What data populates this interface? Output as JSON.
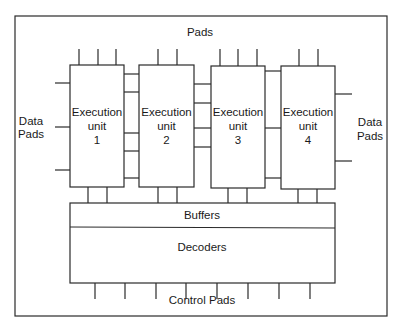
{
  "diagram": {
    "type": "block-diagram",
    "top_label": "Pads",
    "left_label": [
      "Data",
      "Pads"
    ],
    "right_label": [
      "Data",
      "Pads"
    ],
    "bottom_label": "Control Pads",
    "units": [
      {
        "line1": "Execution",
        "line2": "unit",
        "line3": "1"
      },
      {
        "line1": "Execution",
        "line2": "unit",
        "line3": "2"
      },
      {
        "line1": "Execution",
        "line2": "unit",
        "line3": "3"
      },
      {
        "line1": "Execution",
        "line2": "unit",
        "line3": "4"
      }
    ],
    "buffers_label": "Buffers",
    "decoders_label": "Decoders",
    "colors": {
      "line": "#2a2a2a",
      "background": "#ffffff",
      "text": "#1a1a1a"
    }
  }
}
